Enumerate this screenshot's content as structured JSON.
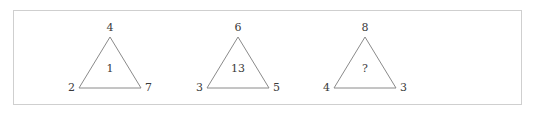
{
  "figure": {
    "name": "number-triangle-puzzle",
    "background_color": "#ffffff",
    "border_color": "#cfcfcf",
    "line_color": "#8a8a8a",
    "text_color": "#3a3a3a",
    "triangles": [
      {
        "id": "triangle-1",
        "apex": "4",
        "bottom_left": "2",
        "bottom_right": "7",
        "center": "1"
      },
      {
        "id": "triangle-2",
        "apex": "6",
        "bottom_left": "3",
        "bottom_right": "5",
        "center": "13"
      },
      {
        "id": "triangle-3",
        "apex": "8",
        "bottom_left": "4",
        "bottom_right": "3",
        "center": "?"
      }
    ]
  }
}
